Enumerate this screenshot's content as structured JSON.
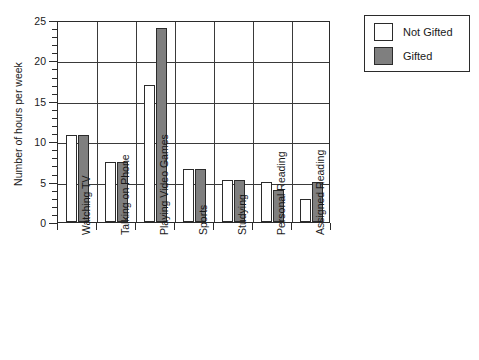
{
  "chart_data": {
    "type": "bar",
    "title": "",
    "xlabel": "",
    "ylabel": "Number of hours per week",
    "ylim": [
      0,
      25
    ],
    "ytick_values": [
      0,
      5,
      10,
      15,
      20,
      25
    ],
    "ytick_labels": [
      "0",
      "5",
      "10",
      "15",
      "20",
      "25"
    ],
    "ytick_minor_step": 1,
    "grid": "major horizontal and vertical category gridlines",
    "legend_position": "upper right, outside plot area",
    "categories": [
      "Watching TV",
      "Talking on Phone",
      "Playing Video Games",
      "Sports",
      "Studying",
      "Personal Reading",
      "Assigned Reading"
    ],
    "series": [
      {
        "name": "Not Gifted",
        "color": "#ffffff",
        "values": [
          10.8,
          7.4,
          17.0,
          6.6,
          5.2,
          4.9,
          2.9
        ]
      },
      {
        "name": "Gifted",
        "color": "#7f7f7f",
        "values": [
          10.8,
          7.4,
          24.0,
          6.6,
          5.2,
          4.0,
          5.0
        ]
      }
    ]
  },
  "legend": {
    "entries": [
      {
        "label": "Not Gifted",
        "swatch": "white-square-swatch"
      },
      {
        "label": "Gifted",
        "swatch": "gray-square-swatch"
      }
    ]
  },
  "colors": {
    "gifted_fill": "#7f7f7f",
    "not_gifted_fill": "#ffffff",
    "axis_line": "#2b2b2b",
    "grid_line": "#3a3a3a",
    "background": "#ffffff"
  }
}
